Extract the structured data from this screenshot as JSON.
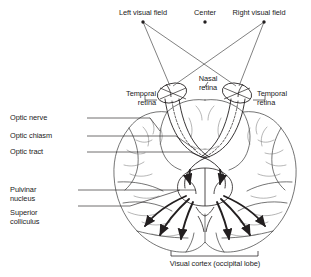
{
  "figure": {
    "type": "anatomical-diagram",
    "background_color": "#ffffff",
    "line_color": "#231f20",
    "text_color": "#1a1a1a"
  },
  "labels": {
    "left_visual_field": "Left visual field",
    "center": "Center",
    "right_visual_field": "Right visual field",
    "nasal_retina": "Nasal\nretina",
    "temporal_retina_left": "Temporal\nretina",
    "temporal_retina_right": "Temporal\nretina",
    "optic_nerve": "Optic nerve",
    "optic_chiasm": "Optic chiasm",
    "optic_tract": "Optic tract",
    "pulvinar_nucleus": "Pulvinar\nnucleus",
    "superior_colliculus": "Superior\ncolliculus",
    "visual_cortex": "Visual cortex (occipital lobe)"
  },
  "markers": {
    "left_field_dot": {
      "x": 143,
      "y": 22
    },
    "center_dot": {
      "x": 205,
      "y": 22
    },
    "right_field_dot": {
      "x": 264,
      "y": 22
    }
  },
  "structures": {
    "left_eye": {
      "cx": 172,
      "cy": 93
    },
    "right_eye": {
      "cx": 237,
      "cy": 93
    },
    "optic_chiasm_crossing": {
      "x": 205,
      "y": 152
    },
    "midbrain": {
      "x": 205,
      "y": 190
    }
  },
  "bracket": {
    "label": "Visual cortex (occipital lobe)",
    "x_start": 171,
    "x_end": 258,
    "y": 256
  }
}
